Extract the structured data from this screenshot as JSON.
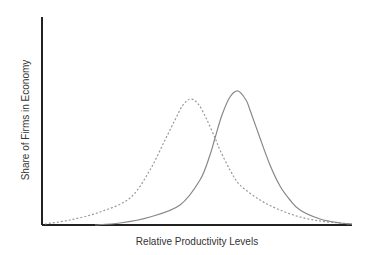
{
  "chart_data": {
    "type": "line",
    "title": "",
    "xlabel": "Relative Productivity Levels",
    "ylabel": "Share of Firms in Economy",
    "grid": false,
    "legend": null,
    "ticks": {
      "x": [],
      "y": []
    },
    "series": [
      {
        "name": "Distribution A (dashed, lower productivity)",
        "style": "dashed",
        "color": "#999999",
        "points_px": [
          [
            45,
            224
          ],
          [
            70,
            220
          ],
          [
            100,
            212
          ],
          [
            130,
            198
          ],
          [
            150,
            170
          ],
          [
            165,
            140
          ],
          [
            175,
            120
          ],
          [
            183,
            105
          ],
          [
            191,
            99
          ],
          [
            199,
            105
          ],
          [
            207,
            120
          ],
          [
            215,
            138
          ],
          [
            220,
            150
          ],
          [
            230,
            170
          ],
          [
            240,
            185
          ],
          [
            260,
            200
          ],
          [
            280,
            210
          ],
          [
            300,
            217
          ],
          [
            320,
            221
          ],
          [
            340,
            223
          ],
          [
            352,
            224
          ]
        ]
      },
      {
        "name": "Distribution B (solid, higher productivity)",
        "style": "solid",
        "color": "#888888",
        "points_px": [
          [
            95,
            225
          ],
          [
            120,
            223
          ],
          [
            150,
            217
          ],
          [
            180,
            205
          ],
          [
            200,
            180
          ],
          [
            210,
            155
          ],
          [
            215,
            138
          ],
          [
            222,
            115
          ],
          [
            230,
            97
          ],
          [
            238,
            91
          ],
          [
            246,
            100
          ],
          [
            250,
            110
          ],
          [
            260,
            138
          ],
          [
            270,
            165
          ],
          [
            280,
            186
          ],
          [
            290,
            200
          ],
          [
            300,
            210
          ],
          [
            320,
            219
          ],
          [
            340,
            223
          ],
          [
            352,
            224
          ]
        ]
      }
    ],
    "axes_px": {
      "origin": [
        42,
        225
      ],
      "y_top": 17,
      "x_right": 352
    }
  }
}
